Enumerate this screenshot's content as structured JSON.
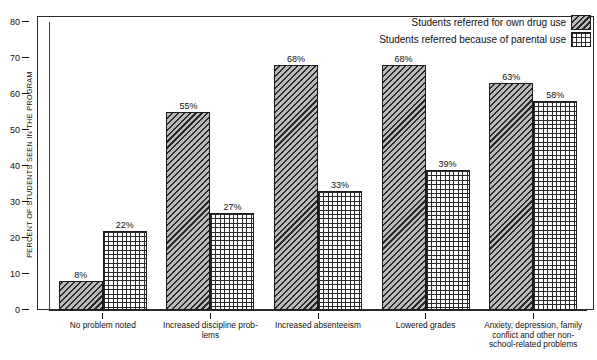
{
  "legend": {
    "items": [
      {
        "label": "Students referred for own drug use",
        "pattern": "diagonal-hatch"
      },
      {
        "label": "Students referred because of parental use",
        "pattern": "grid-crosshatch"
      }
    ]
  },
  "chart_data": {
    "type": "bar",
    "xlabel": "",
    "ylabel": "PERCENT OF STUDENTS SEEN IN THE PROGRAM",
    "ylim": [
      0,
      80
    ],
    "yticks": [
      0,
      10,
      20,
      30,
      40,
      50,
      60,
      70,
      80
    ],
    "ytick_labels": [
      "0",
      "10",
      "20",
      "30",
      "40",
      "50",
      "60",
      "70",
      "80"
    ],
    "grid": false,
    "legend_position": "top-right",
    "value_suffix": "%",
    "categories": [
      "No problem noted",
      "Increased discipline prob-lems",
      "Increased absenteeism",
      "Lowered grades",
      "Anxiety, depression, family conflict and other non-school-related problems"
    ],
    "category_lines": [
      [
        "No problem noted"
      ],
      [
        "Increased discipline prob-",
        "lems"
      ],
      [
        "Increased absenteeism"
      ],
      [
        "Lowered grades"
      ],
      [
        "Anxiety, depression, family",
        "conflict and other non-",
        "school-related problems"
      ]
    ],
    "series": [
      {
        "name": "Students referred for own drug use",
        "pattern": "diagonal-hatch",
        "values": [
          8,
          55,
          68,
          68,
          63
        ],
        "labels": [
          "8%",
          "55%",
          "68%",
          "68%",
          "63%"
        ]
      },
      {
        "name": "Students referred because of parental use",
        "pattern": "grid-crosshatch",
        "values": [
          22,
          27,
          33,
          39,
          58
        ],
        "labels": [
          "22%",
          "27%",
          "33%",
          "39%",
          "58%"
        ]
      }
    ]
  }
}
